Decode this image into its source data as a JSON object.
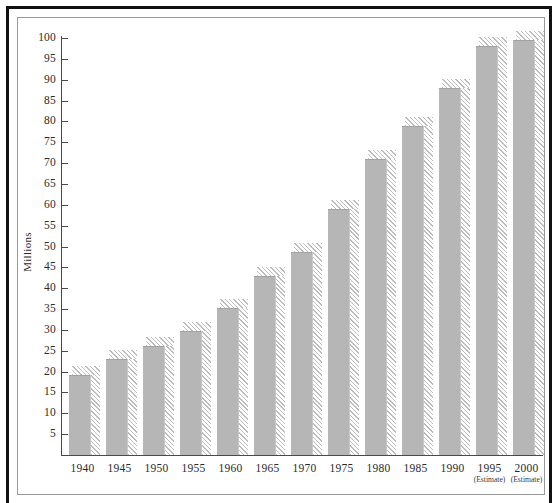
{
  "chart_data": {
    "type": "bar",
    "title": "",
    "subtitle": "",
    "xlabel": "",
    "ylabel": "Millions",
    "ylim": [
      0,
      100
    ],
    "yticks": [
      5,
      10,
      15,
      20,
      25,
      30,
      35,
      40,
      45,
      50,
      55,
      60,
      65,
      70,
      75,
      80,
      85,
      90,
      95,
      100
    ],
    "grid": false,
    "legend": "none",
    "bar_style": "solid-gray-with-diagonal-hatched-drop-shadow",
    "colors": {
      "bar_fill": "#b6b6b6",
      "hatch_line": "#bdbdbd",
      "axis": "#4a4a4a",
      "frame": "#9a9a9a",
      "outer_rule": "#111111",
      "text": "#2b2b2b",
      "background": "#ffffff"
    },
    "categories": [
      "1940",
      "1945",
      "1950",
      "1955",
      "1960",
      "1965",
      "1970",
      "1975",
      "1980",
      "1985",
      "1990",
      "1995",
      "2000"
    ],
    "category_notes": [
      "",
      "",
      "",
      "",
      "",
      "",
      "",
      "",
      "",
      "",
      "",
      "(Estimate)",
      "(Estimate)"
    ],
    "values": [
      19.3,
      23.0,
      26.2,
      29.8,
      35.2,
      43.0,
      48.7,
      59.0,
      71.0,
      78.8,
      88.0,
      98.0,
      99.6
    ],
    "series": [
      {
        "name": "Millions",
        "values": [
          19.3,
          23.0,
          26.2,
          29.8,
          35.2,
          43.0,
          48.7,
          59.0,
          71.0,
          78.8,
          88.0,
          98.0,
          99.6
        ]
      }
    ]
  }
}
